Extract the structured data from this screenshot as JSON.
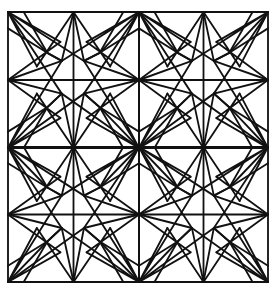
{
  "figure": {
    "grid": {
      "rows": 2,
      "cols": 2
    },
    "colors": {
      "line": "#111111",
      "background": "#ffffff"
    },
    "frame": {
      "x": 8,
      "y": 12,
      "width": 260,
      "height": 270
    }
  }
}
